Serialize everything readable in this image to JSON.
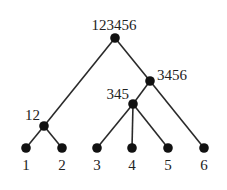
{
  "diagram": {
    "type": "tree",
    "title": "",
    "nodes": [
      {
        "id": "root",
        "label": "123456",
        "x": 115,
        "y": 38,
        "lx": 114,
        "ly": 30,
        "anchor": "middle"
      },
      {
        "id": "n3456",
        "label": "3456",
        "x": 150,
        "y": 81,
        "lx": 157,
        "ly": 80,
        "anchor": "start"
      },
      {
        "id": "n345",
        "label": "345",
        "x": 133,
        "y": 104,
        "lx": 129,
        "ly": 99,
        "anchor": "end"
      },
      {
        "id": "n12",
        "label": "12",
        "x": 44,
        "y": 126,
        "lx": 40,
        "ly": 120,
        "anchor": "end"
      },
      {
        "id": "l1",
        "label": "1",
        "x": 26,
        "y": 148,
        "lx": 26,
        "ly": 170,
        "anchor": "middle"
      },
      {
        "id": "l2",
        "label": "2",
        "x": 62,
        "y": 148,
        "lx": 62,
        "ly": 170,
        "anchor": "middle"
      },
      {
        "id": "l3",
        "label": "3",
        "x": 97,
        "y": 148,
        "lx": 97,
        "ly": 170,
        "anchor": "middle"
      },
      {
        "id": "l4",
        "label": "4",
        "x": 132,
        "y": 148,
        "lx": 132,
        "ly": 170,
        "anchor": "middle"
      },
      {
        "id": "l5",
        "label": "5",
        "x": 168,
        "y": 148,
        "lx": 168,
        "ly": 170,
        "anchor": "middle"
      },
      {
        "id": "l6",
        "label": "6",
        "x": 204,
        "y": 148,
        "lx": 204,
        "ly": 170,
        "anchor": "middle"
      }
    ],
    "edges": [
      [
        "root",
        "n12"
      ],
      [
        "root",
        "n3456"
      ],
      [
        "n3456",
        "n345"
      ],
      [
        "n3456",
        "l6"
      ],
      [
        "n345",
        "l3"
      ],
      [
        "n345",
        "l4"
      ],
      [
        "n345",
        "l5"
      ],
      [
        "n12",
        "l1"
      ],
      [
        "n12",
        "l2"
      ]
    ],
    "colors": {
      "edge": "#2a2a2a",
      "node": "#111111",
      "label": "#222222"
    }
  }
}
